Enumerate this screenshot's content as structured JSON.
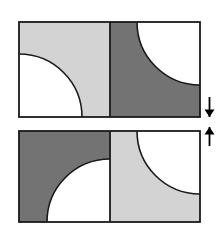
{
  "canvas": {
    "width": 223,
    "height": 239,
    "background": "#ffffff"
  },
  "palette": {
    "light_gray": "#d3d3d3",
    "dark_gray": "#737373",
    "white": "#ffffff",
    "stroke": "#1a1a1a",
    "arrow": "#000000"
  },
  "figures": [
    {
      "id": "top-figure",
      "label": "Top figure",
      "frame": {
        "x": 19,
        "y": 22,
        "width": 181,
        "height": 95
      },
      "divider_x": 110,
      "panels": [
        {
          "id": "top-left-panel",
          "label": "Top left panel",
          "fill": "#d3d3d3",
          "rect": {
            "x": 19,
            "y": 22,
            "width": 91,
            "height": 95
          },
          "shape": "quarter-circle",
          "shape_fill": "#ffffff",
          "corner": "bottom-left",
          "radius": 63
        },
        {
          "id": "top-right-panel",
          "label": "Top right panel",
          "fill": "#737373",
          "rect": {
            "x": 110,
            "y": 22,
            "width": 90,
            "height": 95
          },
          "shape": "quarter-circle",
          "shape_fill": "#ffffff",
          "corner": "top-right",
          "radius": 63
        }
      ]
    },
    {
      "id": "bottom-figure",
      "label": "Bottom figure",
      "frame": {
        "x": 19,
        "y": 131,
        "width": 181,
        "height": 91
      },
      "divider_x": 110,
      "panels": [
        {
          "id": "bottom-left-panel",
          "label": "Bottom left panel",
          "fill": "#737373",
          "rect": {
            "x": 19,
            "y": 131,
            "width": 91,
            "height": 91
          },
          "shape": "quarter-circle",
          "shape_fill": "#ffffff",
          "corner": "bottom-right",
          "radius": 63
        },
        {
          "id": "bottom-right-panel",
          "label": "Bottom right panel",
          "fill": "#d3d3d3",
          "rect": {
            "x": 110,
            "y": 131,
            "width": 90,
            "height": 91
          },
          "shape": "quarter-circle",
          "shape_fill": "#ffffff",
          "corner": "top-right",
          "radius": 63
        }
      ]
    }
  ],
  "arrows": [
    {
      "id": "down-arrow",
      "label": "Down arrow",
      "direction": "down",
      "glyph": "↓",
      "x": 209.5,
      "top": 97,
      "bottom": 117,
      "color": "#000000"
    },
    {
      "id": "up-arrow",
      "label": "Up arrow",
      "direction": "up",
      "glyph": "↑",
      "x": 209.5,
      "top": 127,
      "bottom": 146,
      "color": "#000000"
    }
  ]
}
